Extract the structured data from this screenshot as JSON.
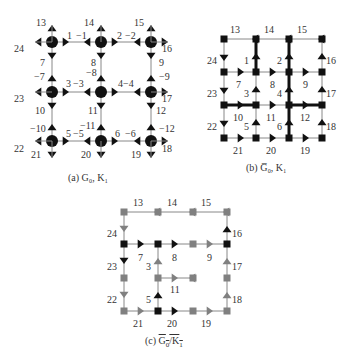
{
  "colors": {
    "black": "#111111",
    "gray": "#808080",
    "line": "#888888",
    "thick": "#111111",
    "text": "#333333"
  },
  "panel_a": {
    "caption": "(a) G₀, K₁",
    "nodes": [
      {
        "id": "a-n1",
        "x": 52,
        "y": 42
      },
      {
        "id": "a-n2",
        "x": 101,
        "y": 42
      },
      {
        "id": "a-n3",
        "x": 151,
        "y": 42
      },
      {
        "id": "a-n4",
        "x": 52,
        "y": 92
      },
      {
        "id": "a-n5",
        "x": 101,
        "y": 92
      },
      {
        "id": "a-n6",
        "x": 151,
        "y": 92
      },
      {
        "id": "a-n7",
        "x": 52,
        "y": 141
      },
      {
        "id": "a-n8",
        "x": 101,
        "y": 141
      },
      {
        "id": "a-n9",
        "x": 151,
        "y": 141
      }
    ],
    "labels": [
      {
        "t": "13",
        "x": 36,
        "y": 26
      },
      {
        "t": "14",
        "x": 84,
        "y": 26
      },
      {
        "t": "15",
        "x": 134,
        "y": 26
      },
      {
        "t": "24",
        "x": 14,
        "y": 52
      },
      {
        "t": "16",
        "x": 162,
        "y": 52
      },
      {
        "t": "1",
        "x": 67,
        "y": 39
      },
      {
        "t": "−1",
        "x": 76,
        "y": 39
      },
      {
        "t": "2",
        "x": 117,
        "y": 39
      },
      {
        "t": "−2",
        "x": 125,
        "y": 39
      },
      {
        "t": "7",
        "x": 40,
        "y": 66
      },
      {
        "t": "−7",
        "x": 34,
        "y": 80
      },
      {
        "t": "8",
        "x": 91,
        "y": 66
      },
      {
        "t": "−8",
        "x": 86,
        "y": 76
      },
      {
        "t": "9",
        "x": 159,
        "y": 66
      },
      {
        "t": "−9",
        "x": 159,
        "y": 80
      },
      {
        "t": "3",
        "x": 66,
        "y": 87
      },
      {
        "t": "−3",
        "x": 73,
        "y": 87
      },
      {
        "t": "4−4",
        "x": 118,
        "y": 87
      },
      {
        "t": "23",
        "x": 14,
        "y": 102
      },
      {
        "t": "17",
        "x": 162,
        "y": 102
      },
      {
        "t": "10",
        "x": 35,
        "y": 114
      },
      {
        "t": "11",
        "x": 88,
        "y": 114
      },
      {
        "t": "12",
        "x": 156,
        "y": 114
      },
      {
        "t": "−10",
        "x": 30,
        "y": 132
      },
      {
        "t": "−11",
        "x": 80,
        "y": 129
      },
      {
        "t": "−12",
        "x": 159,
        "y": 132
      },
      {
        "t": "5",
        "x": 66,
        "y": 137
      },
      {
        "t": "−5",
        "x": 73,
        "y": 137
      },
      {
        "t": "6",
        "x": 115,
        "y": 137
      },
      {
        "t": "−6",
        "x": 125,
        "y": 137
      },
      {
        "t": "22",
        "x": 14,
        "y": 152
      },
      {
        "t": "18",
        "x": 162,
        "y": 152
      },
      {
        "t": "21",
        "x": 31,
        "y": 158
      },
      {
        "t": "20",
        "x": 81,
        "y": 158
      },
      {
        "t": "19",
        "x": 131,
        "y": 158
      }
    ]
  },
  "panel_b": {
    "caption": "(b) G̅₀, K₁",
    "cols": [
      224,
      256,
      289,
      322
    ],
    "rows": [
      39,
      72,
      105,
      138
    ],
    "labels": [
      {
        "t": "13",
        "x": 230,
        "y": 33
      },
      {
        "t": "14",
        "x": 264,
        "y": 33
      },
      {
        "t": "15",
        "x": 297,
        "y": 33
      },
      {
        "t": "24",
        "x": 207,
        "y": 64
      },
      {
        "t": "1",
        "x": 244,
        "y": 64
      },
      {
        "t": "2",
        "x": 277,
        "y": 64
      },
      {
        "t": "16",
        "x": 326,
        "y": 64
      },
      {
        "t": "7",
        "x": 236,
        "y": 88
      },
      {
        "t": "8",
        "x": 270,
        "y": 88
      },
      {
        "t": "9",
        "x": 303,
        "y": 88
      },
      {
        "t": "23",
        "x": 207,
        "y": 97
      },
      {
        "t": "3",
        "x": 244,
        "y": 97
      },
      {
        "t": "4",
        "x": 277,
        "y": 97
      },
      {
        "t": "17",
        "x": 326,
        "y": 97
      },
      {
        "t": "10",
        "x": 233,
        "y": 121
      },
      {
        "t": "11",
        "x": 266,
        "y": 121
      },
      {
        "t": "12",
        "x": 300,
        "y": 121
      },
      {
        "t": "22",
        "x": 207,
        "y": 130
      },
      {
        "t": "5",
        "x": 244,
        "y": 130
      },
      {
        "t": "6",
        "x": 277,
        "y": 130
      },
      {
        "t": "18",
        "x": 326,
        "y": 130
      },
      {
        "t": "21",
        "x": 233,
        "y": 154
      },
      {
        "t": "20",
        "x": 266,
        "y": 154
      },
      {
        "t": "19",
        "x": 300,
        "y": 154
      }
    ]
  },
  "panel_c": {
    "caption": "(c) G₀/K₁",
    "cols": [
      124,
      158,
      193,
      227
    ],
    "rows": [
      212,
      244,
      278,
      311
    ],
    "labels": [
      {
        "t": "13",
        "x": 133,
        "y": 206
      },
      {
        "t": "14",
        "x": 167,
        "y": 206
      },
      {
        "t": "15",
        "x": 201,
        "y": 206
      },
      {
        "t": "24",
        "x": 107,
        "y": 237
      },
      {
        "t": "16",
        "x": 232,
        "y": 237
      },
      {
        "t": "7",
        "x": 138,
        "y": 261
      },
      {
        "t": "8",
        "x": 172,
        "y": 261
      },
      {
        "t": "9",
        "x": 207,
        "y": 261
      },
      {
        "t": "23",
        "x": 107,
        "y": 270
      },
      {
        "t": "3",
        "x": 146,
        "y": 270
      },
      {
        "t": "17",
        "x": 232,
        "y": 270
      },
      {
        "t": "11",
        "x": 170,
        "y": 293
      },
      {
        "t": "22",
        "x": 107,
        "y": 303
      },
      {
        "t": "5",
        "x": 146,
        "y": 303
      },
      {
        "t": "18",
        "x": 232,
        "y": 303
      },
      {
        "t": "21",
        "x": 133,
        "y": 327
      },
      {
        "t": "20",
        "x": 167,
        "y": 327
      },
      {
        "t": "19",
        "x": 201,
        "y": 327
      }
    ]
  }
}
